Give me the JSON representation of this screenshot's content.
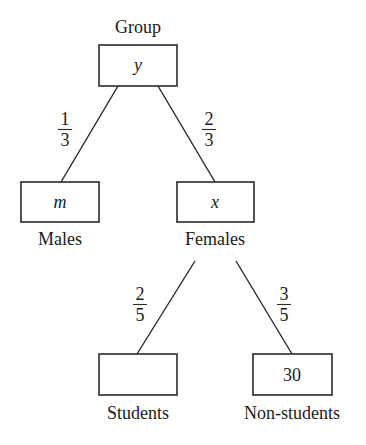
{
  "diagram": {
    "type": "tree",
    "root": {
      "label": "Group",
      "value": "y",
      "value_style": "italic"
    },
    "level1": [
      {
        "label": "Males",
        "value": "m",
        "value_style": "italic",
        "edge_fraction": {
          "numerator": "1",
          "denominator": "3"
        }
      },
      {
        "label": "Females",
        "value": "x",
        "value_style": "italic",
        "edge_fraction": {
          "numerator": "2",
          "denominator": "3"
        }
      }
    ],
    "level2": [
      {
        "parent": "Females",
        "label": "Students",
        "value": "",
        "edge_fraction": {
          "numerator": "2",
          "denominator": "5"
        }
      },
      {
        "parent": "Females",
        "label": "Non-students",
        "value": "30",
        "edge_fraction": {
          "numerator": "3",
          "denominator": "5"
        }
      }
    ]
  }
}
